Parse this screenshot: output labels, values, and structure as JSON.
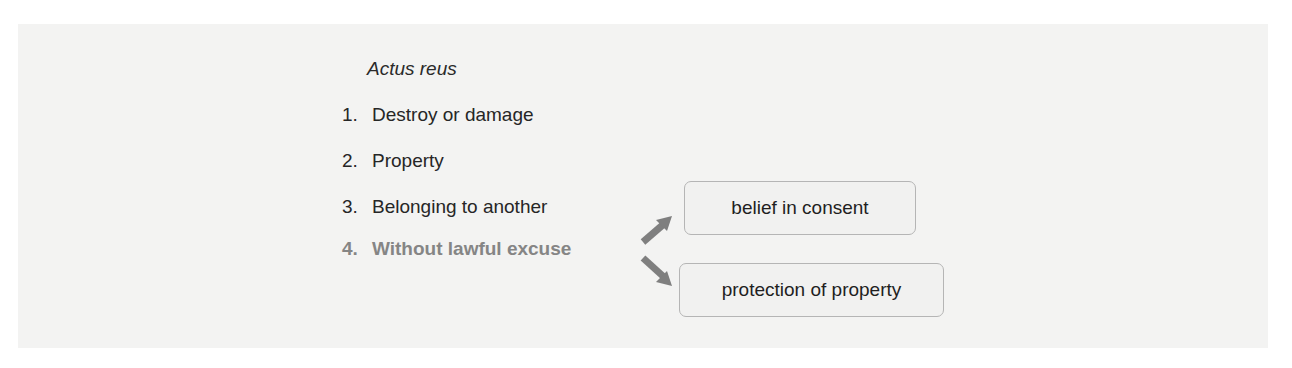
{
  "heading": "Actus reus",
  "items": [
    {
      "num": "1.",
      "label": "Destroy or damage"
    },
    {
      "num": "2.",
      "label": "Property"
    },
    {
      "num": "3.",
      "label": "Belonging to another"
    },
    {
      "num": "4.",
      "label": "Without lawful excuse"
    }
  ],
  "branches": [
    {
      "label": "belief in consent"
    },
    {
      "label": "protection of property"
    }
  ],
  "colors": {
    "highlight": "#858585",
    "arrow": "#7f7f7f",
    "panel": "#f3f3f2"
  }
}
